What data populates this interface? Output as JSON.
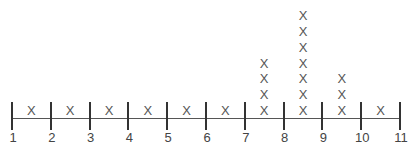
{
  "chart_data": {
    "type": "dot_plot",
    "title": "",
    "xlabel": "",
    "ylabel": "",
    "marker": "X",
    "tick_labels": [
      "1",
      "2",
      "3",
      "4",
      "5",
      "6",
      "7",
      "8",
      "9",
      "10",
      "11"
    ],
    "xlim": [
      1,
      11
    ],
    "categories": [
      "1-2",
      "2-3",
      "3-4",
      "4-5",
      "5-6",
      "6-7",
      "7-8",
      "8-9",
      "9-10",
      "10-11"
    ],
    "values": [
      1,
      1,
      1,
      1,
      1,
      1,
      4,
      7,
      3,
      1
    ],
    "grid": false,
    "legend": null
  },
  "colors": {
    "axis": "#555555",
    "tick": "#333333",
    "marker": "#555555",
    "label": "#444444"
  }
}
